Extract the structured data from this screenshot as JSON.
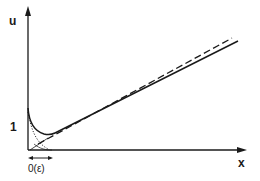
{
  "diagram": {
    "axes": {
      "y_label": "u",
      "x_label": "x",
      "y_tick_label": "1",
      "boundary_layer_label": "0(ε)"
    },
    "curves": [
      {
        "name": "exact-solution",
        "style": "solid",
        "description": "starts at u=1, drops in boundary layer, then rises linearly"
      },
      {
        "name": "outer-solution",
        "style": "dashed",
        "description": "straight line approximation"
      },
      {
        "name": "inner-solution",
        "style": "dotted",
        "description": "exponential decay in boundary layer"
      },
      {
        "name": "outer-extension",
        "style": "thin-solid",
        "description": "outer solution continued into boundary layer"
      }
    ],
    "colors": {
      "ink": "#1a1a1a",
      "background": "#ffffff"
    }
  }
}
